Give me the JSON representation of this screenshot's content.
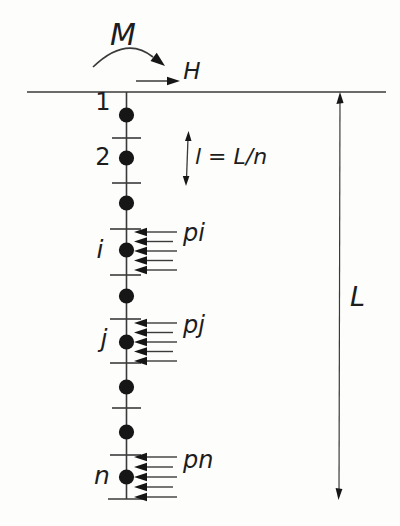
{
  "labels": {
    "moment": "M",
    "horizontal_force": "H",
    "node_1": "1",
    "node_2": "2",
    "node_i": "i",
    "node_j": "j",
    "node_n": "n",
    "element_length": "l = L/n",
    "load_i": "pi",
    "load_j": "pj",
    "load_n": "pn",
    "pile_length": "L"
  },
  "colors": {
    "ink": "#3a3a3a",
    "marks": "#161616",
    "background": "#fdfdfc"
  }
}
